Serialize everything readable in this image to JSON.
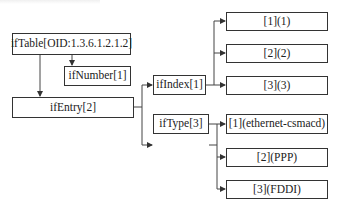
{
  "diagram": {
    "type": "tree",
    "title": "",
    "nodes": {
      "iftable": "ifTable[OID:1.3.6.1.2.1.2]",
      "ifnumber": "ifNumber[1]",
      "ifentry": "ifEntry[2]",
      "ifindex": "ifIndex[1]",
      "iftype": "ifType[3]",
      "index_values": [
        "[1](1)",
        "[2](2)",
        "[3](3)"
      ],
      "type_values": [
        "[1](ethernet-csmacd)",
        "[2](PPP)",
        "[3](FDDI)"
      ]
    },
    "edges": [
      [
        "ifTable[OID:1.3.6.1.2.1.2]",
        "ifNumber[1]"
      ],
      [
        "ifTable[OID:1.3.6.1.2.1.2]",
        "ifEntry[2]"
      ],
      [
        "ifEntry[2]",
        "ifIndex[1]"
      ],
      [
        "ifEntry[2]",
        "ifType[3]"
      ],
      [
        "ifIndex[1]",
        "[1](1)"
      ],
      [
        "ifIndex[1]",
        "[2](2)"
      ],
      [
        "ifIndex[1]",
        "[3](3)"
      ],
      [
        "ifType[3]",
        "[1](ethernet-csmacd)"
      ],
      [
        "ifType[3]",
        "[2](PPP)"
      ],
      [
        "ifType[3]",
        "[3](FDDI)"
      ]
    ],
    "colors": {
      "line": "#333333",
      "background": "#ffffff",
      "text": "#222222"
    }
  }
}
